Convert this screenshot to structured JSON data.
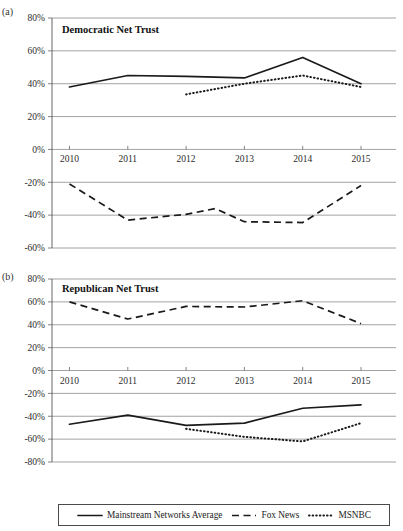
{
  "figure": {
    "panel_a_letter": "(a)",
    "panel_b_letter": "(b)"
  },
  "legend": {
    "entries": [
      {
        "label": "Mainstream Networks Average",
        "style": "solid",
        "icon": "solid-line-swatch-icon"
      },
      {
        "label": "Fox News",
        "style": "dashed",
        "icon": "dashed-line-swatch-icon"
      },
      {
        "label": "MSNBC",
        "style": "dotted",
        "icon": "dotted-line-swatch-icon"
      }
    ]
  },
  "chart_data": [
    {
      "id": "panel-a",
      "type": "line",
      "title": "Democratic Net Trust",
      "panel_label": "(a)",
      "xlabel": "",
      "ylabel": "",
      "x": [
        2010,
        2011,
        2012,
        2013,
        2014,
        2015
      ],
      "xtick_labels": [
        "2010",
        "2011",
        "2012",
        "2013",
        "2014",
        "2015"
      ],
      "xlim": [
        2009.7,
        2015.6
      ],
      "ylim": [
        -60,
        80
      ],
      "ytick_values": [
        80,
        60,
        40,
        20,
        0,
        -20,
        -40,
        -60
      ],
      "ytick_labels": [
        "80%",
        "60%",
        "40%",
        "20%",
        "0%",
        "-20%",
        "-40%",
        "-60%"
      ],
      "grid": true,
      "legend_position": "below-figure",
      "series": [
        {
          "name": "Mainstream Networks Average",
          "style": "solid",
          "x": [
            2010,
            2011,
            2012,
            2013,
            2014,
            2015
          ],
          "values": [
            38,
            45,
            44.5,
            43.5,
            56,
            40
          ]
        },
        {
          "name": "Fox News",
          "style": "dashed",
          "x": [
            2010,
            2011,
            2012,
            2012.5,
            2013,
            2014,
            2015
          ],
          "values": [
            -21,
            -43,
            -39.5,
            -36,
            -44,
            -44.5,
            -22
          ]
        },
        {
          "name": "MSNBC",
          "style": "dotted",
          "x": [
            2012,
            2013,
            2014,
            2015
          ],
          "values": [
            33.5,
            40,
            45,
            38
          ]
        }
      ]
    },
    {
      "id": "panel-b",
      "type": "line",
      "title": "Republican Net Trust",
      "panel_label": "(b)",
      "xlabel": "",
      "ylabel": "",
      "x": [
        2010,
        2011,
        2012,
        2013,
        2014,
        2015
      ],
      "xtick_labels": [
        "2010",
        "2011",
        "2012",
        "2013",
        "2014",
        "2015"
      ],
      "xlim": [
        2009.7,
        2015.6
      ],
      "ylim": [
        -80,
        80
      ],
      "ytick_values": [
        80,
        60,
        40,
        20,
        0,
        -20,
        -40,
        -60,
        -80
      ],
      "ytick_labels": [
        "80%",
        "60%",
        "40%",
        "20%",
        "0%",
        "-20%",
        "-40%",
        "-60%",
        "-80%"
      ],
      "grid": true,
      "legend_position": "below-figure",
      "series": [
        {
          "name": "Mainstream Networks Average",
          "style": "solid",
          "x": [
            2010,
            2011,
            2012,
            2013,
            2014,
            2015
          ],
          "values": [
            -47,
            -39,
            -48,
            -46,
            -33,
            -30
          ]
        },
        {
          "name": "Fox News",
          "style": "dashed",
          "x": [
            2010,
            2011,
            2012,
            2013,
            2014,
            2015
          ],
          "values": [
            60,
            45,
            56,
            55.5,
            61,
            41
          ]
        },
        {
          "name": "MSNBC",
          "style": "dotted",
          "x": [
            2012,
            2013,
            2014,
            2015
          ],
          "values": [
            -51,
            -58,
            -62,
            -46
          ]
        }
      ]
    }
  ]
}
